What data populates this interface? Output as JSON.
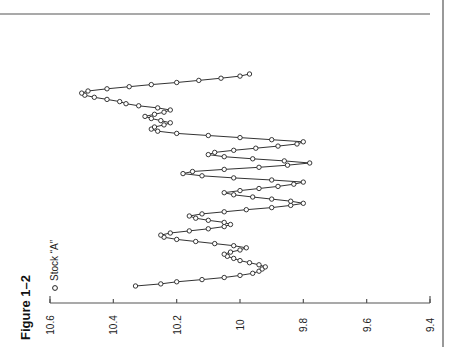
{
  "figure": {
    "title": "Figure 1–2",
    "legend": "Stock “A”"
  },
  "chart_data": {
    "type": "line",
    "title": "Figure 1–2",
    "xlabel": "",
    "ylabel": "",
    "ylim": [
      9.4,
      10.6
    ],
    "yticks": [
      "10.6",
      "10.4",
      "10.2",
      "10",
      "9.8",
      "9.6",
      "9.4"
    ],
    "orientation": "rotated 90° counter-clockwise (value axis along bottom edge, time runs bottom-to-top)",
    "grid": false,
    "legend_position": "top-left (rotated)",
    "series": [
      {
        "name": "Stock “A”",
        "marker": "open circle",
        "values": [
          10.33,
          10.25,
          10.2,
          10.12,
          10.05,
          10.0,
          9.96,
          9.94,
          9.93,
          9.92,
          9.94,
          9.97,
          10.0,
          10.02,
          10.04,
          10.05,
          10.03,
          10.0,
          9.98,
          10.02,
          10.08,
          10.14,
          10.2,
          10.24,
          10.25,
          10.22,
          10.16,
          10.1,
          10.05,
          10.03,
          10.05,
          10.1,
          10.14,
          10.16,
          10.12,
          10.05,
          9.98,
          9.9,
          9.84,
          9.8,
          9.84,
          9.9,
          9.96,
          10.02,
          10.05,
          10.0,
          9.94,
          9.88,
          9.83,
          9.8,
          9.9,
          10.02,
          10.12,
          10.18,
          10.15,
          10.05,
          9.94,
          9.85,
          9.78,
          9.86,
          9.96,
          10.05,
          10.1,
          10.08,
          10.02,
          9.95,
          9.88,
          9.82,
          9.8,
          9.9,
          10.0,
          10.1,
          10.2,
          10.26,
          10.28,
          10.27,
          10.24,
          10.22,
          10.25,
          10.28,
          10.3,
          10.27,
          10.24,
          10.22,
          10.26,
          10.32,
          10.36,
          10.38,
          10.42,
          10.46,
          10.49,
          10.5,
          10.48,
          10.42,
          10.35,
          10.28,
          10.2,
          10.13,
          10.06,
          10.0,
          9.97
        ]
      }
    ]
  }
}
